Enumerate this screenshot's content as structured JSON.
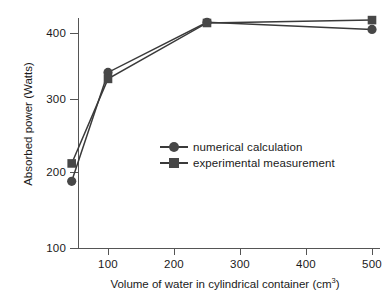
{
  "chart_data": {
    "type": "line",
    "title": "",
    "xlabel": "Volume of water in cylindrical container (cm3)",
    "xlabel_main": "Volume of water in cylindrical container (cm",
    "xlabel_sup": "3",
    "xlabel_tail": ")",
    "ylabel": "Absorbed power (Watts)",
    "x": [
      45,
      100,
      250,
      500
    ],
    "xlim": [
      0,
      530
    ],
    "ylim": [
      100,
      440
    ],
    "xticks": [
      100,
      200,
      300,
      400,
      500
    ],
    "xtick_labels": [
      "100",
      "200",
      "300",
      "400",
      "500"
    ],
    "yticks": [
      100,
      200,
      300,
      400
    ],
    "ytick_labels": [
      "100",
      "200",
      "300",
      "400"
    ],
    "grid": false,
    "legend_position": "center-right",
    "series": [
      {
        "name": "numerical calculation",
        "marker": "circle",
        "color": "#474747",
        "values": [
          193,
          345,
          415,
          405
        ]
      },
      {
        "name": "experimental measurement",
        "marker": "square",
        "color": "#474747",
        "values": [
          218,
          336,
          414,
          418
        ]
      }
    ]
  },
  "legend": {
    "items": [
      {
        "label": "numerical calculation",
        "marker": "circle"
      },
      {
        "label": "experimental measurement",
        "marker": "square"
      }
    ]
  },
  "colors": {
    "line": "#3a3a3a",
    "marker": "#474747",
    "axis": "#555555",
    "text": "#1a1a1a",
    "background": "#ffffff"
  }
}
